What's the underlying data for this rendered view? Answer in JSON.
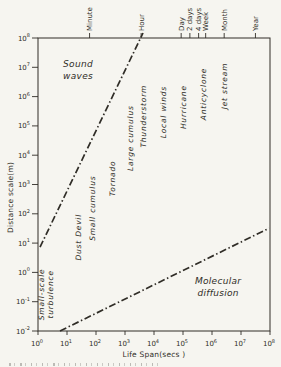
{
  "figure": {
    "background": "#f6f5f0",
    "ink": "#302d27"
  },
  "chart_data": {
    "type": "line",
    "title": "",
    "xlabel": "Life Span(secs )",
    "ylabel": "Distance scale(m)",
    "grid": false,
    "x_axis": {
      "scale": "log",
      "unit": "seconds",
      "exp_range": [
        0,
        8
      ],
      "tick_mantissa": "10",
      "tick_exponents": [
        0,
        1,
        2,
        3,
        4,
        5,
        6,
        7,
        8
      ]
    },
    "y_axis": {
      "scale": "log",
      "unit": "metres",
      "exp_range": [
        -2,
        8
      ],
      "tick_mantissa": "10",
      "tick_exponents": [
        8,
        7,
        6,
        5,
        4,
        3,
        2,
        1,
        0,
        -1,
        -2
      ]
    },
    "top_axis_ticks": [
      {
        "slug": "minute",
        "label": "Minute",
        "seconds": 60
      },
      {
        "slug": "hour",
        "label": "Hour",
        "seconds": 3600
      },
      {
        "slug": "day",
        "label": "Day",
        "seconds": 86400
      },
      {
        "slug": "2-days",
        "label": "2 days",
        "seconds": 172800
      },
      {
        "slug": "4-days",
        "label": "4 days",
        "seconds": 345600
      },
      {
        "slug": "week",
        "label": "Week",
        "seconds": 604800
      },
      {
        "slug": "month",
        "label": "Month",
        "seconds": 2630000
      },
      {
        "slug": "year",
        "label": "Year",
        "seconds": 31500000
      }
    ],
    "series": [
      {
        "name": "Sound waves limit",
        "slug": "sound-waves-line",
        "style": "dash-dot",
        "points": [
          {
            "t_exp": 0.07,
            "d_exp": 0.86
          },
          {
            "t_exp": 3.62,
            "d_exp": 8.17
          }
        ]
      },
      {
        "name": "Molecular diffusion limit",
        "slug": "molecular-diffusion-line",
        "style": "dash-dot",
        "points": [
          {
            "t_exp": 0.76,
            "d_exp": -2.0
          },
          {
            "t_exp": 7.97,
            "d_exp": 1.51
          }
        ]
      }
    ],
    "annotations": [
      {
        "slug": "sound-waves",
        "lines": [
          "Sound",
          "waves"
        ],
        "t_exp": 1.38,
        "d_exp": 6.91,
        "rotated": false,
        "size": 9
      },
      {
        "slug": "molecular-diffusion",
        "lines": [
          "Molecular",
          "diffusion"
        ],
        "t_exp": 6.21,
        "d_exp": -0.51,
        "rotated": false,
        "size": 9
      },
      {
        "slug": "small-scale-turbulence",
        "lines": [
          "Small-scale",
          "turbulence"
        ],
        "t_exp": 0.17,
        "d_exp": -0.75,
        "rotated": true,
        "size": 7.5
      },
      {
        "slug": "dust-devil",
        "lines": [
          "Dust Devil"
        ],
        "t_exp": 1.28,
        "d_exp": 1.2,
        "rotated": true,
        "size": 7.5
      },
      {
        "slug": "small-cumulus",
        "lines": [
          "Small cumulus"
        ],
        "t_exp": 1.79,
        "d_exp": 2.19,
        "rotated": true,
        "size": 7.5
      },
      {
        "slug": "tornado",
        "lines": [
          "Tornado"
        ],
        "t_exp": 2.45,
        "d_exp": 3.21,
        "rotated": true,
        "size": 7.5
      },
      {
        "slug": "large-cumulus",
        "lines": [
          "Large cumulus"
        ],
        "t_exp": 3.07,
        "d_exp": 4.58,
        "rotated": true,
        "size": 7.5
      },
      {
        "slug": "thunderstorm",
        "lines": [
          "Thunderstorm"
        ],
        "t_exp": 3.55,
        "d_exp": 5.33,
        "rotated": true,
        "size": 7.5
      },
      {
        "slug": "local-winds",
        "lines": [
          "Local winds"
        ],
        "t_exp": 4.21,
        "d_exp": 5.47,
        "rotated": true,
        "size": 7.5
      },
      {
        "slug": "hurricane",
        "lines": [
          "Hurricane"
        ],
        "t_exp": 4.9,
        "d_exp": 5.64,
        "rotated": true,
        "size": 7.5
      },
      {
        "slug": "anticyclone",
        "lines": [
          "Anticyclone"
        ],
        "t_exp": 5.62,
        "d_exp": 6.09,
        "rotated": true,
        "size": 7.5
      },
      {
        "slug": "jet-stream",
        "lines": [
          "Jet stream"
        ],
        "t_exp": 6.34,
        "d_exp": 6.36,
        "rotated": true,
        "size": 7.5
      }
    ]
  }
}
